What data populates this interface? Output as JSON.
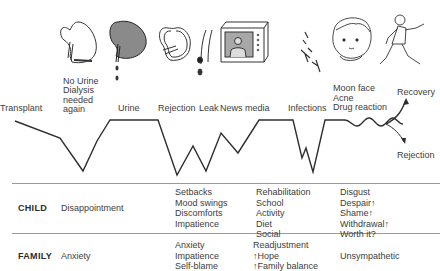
{
  "stages": [
    {
      "id": "transplant",
      "label": "Transplant",
      "icon": "none"
    },
    {
      "id": "no-urine",
      "label_lines": [
        "No Urine",
        "Dialysis",
        "needed",
        "again"
      ],
      "icon": "kidney-outline-icon"
    },
    {
      "id": "urine",
      "label": "Urine",
      "icon": "kidney-filled-icon"
    },
    {
      "id": "rejection",
      "label": "Rejection",
      "icon": "kidney-shrunken-icon"
    },
    {
      "id": "leak",
      "label": "Leak",
      "icon": "ureter-leak-icon"
    },
    {
      "id": "news-media",
      "label": "News media",
      "icon": "television-icon"
    },
    {
      "id": "infections",
      "label": "Infections",
      "icon": "bacteria-icon"
    },
    {
      "id": "drug-reaction",
      "label_lines": [
        "Moon face",
        "Acne",
        "Drug reaction"
      ],
      "icon": "child-face-icon"
    },
    {
      "id": "recovery",
      "label": "Recovery",
      "icon": "running-child-icon"
    }
  ],
  "outcomes": {
    "recovery": "Recovery",
    "rejection": "Rejection"
  },
  "rows": {
    "child": {
      "heading": "CHILD",
      "cols": [
        [
          "Disappointment"
        ],
        [
          "Setbacks",
          "Mood swings",
          "Discomforts",
          "Impatience"
        ],
        [
          "Rehabilitation",
          "School",
          "Activity",
          "Diet",
          "Social"
        ],
        [
          "Disgust",
          "Despair↑",
          "Shame↑",
          "Withdrawal↑",
          "Worth it?"
        ]
      ]
    },
    "family": {
      "heading": "FAMILY",
      "cols": [
        [
          "Anxiety"
        ],
        [
          "Anxiety",
          "Impatience",
          "Self-blame"
        ],
        [
          "Readjustment",
          "↑Hope",
          "↑Family balance"
        ],
        [
          "Unsympathetic"
        ]
      ]
    }
  },
  "colors": {
    "line": "#2e2e2e",
    "text": "#3c3c3c",
    "divider": "#9a9a9a"
  }
}
